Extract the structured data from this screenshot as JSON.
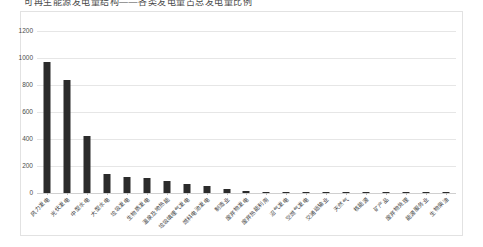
{
  "title": "可再生能源发电量结构——各类发电量占总发电量比例",
  "chart_data": {
    "type": "bar",
    "title": "可再生能源发电量结构——各类发电量占总发电量比例",
    "xlabel": "",
    "ylabel": "",
    "ylim": [
      0,
      1200
    ],
    "yticks": [
      0,
      200,
      400,
      600,
      800,
      1000,
      1200
    ],
    "grid": true,
    "legend": false,
    "bar_color": "#2b2b2b",
    "categories": [
      "风力发电",
      "光伏发电",
      "中型水电",
      "大型水电",
      "垃圾发电",
      "生物质发电",
      "温泉及地热能",
      "垃圾填埋气发电",
      "燃料电池发电",
      "制造业",
      "废弃物发电",
      "废弃热能利用",
      "沼气发电",
      "空燃气发电",
      "交通运输业",
      "天然气",
      "核能源",
      "矿产品",
      "废弃物处理",
      "能源服务业",
      "生物柴油"
    ],
    "values": [
      970,
      840,
      425,
      140,
      120,
      108,
      92,
      70,
      55,
      30,
      14,
      10,
      9,
      8,
      8,
      7,
      7,
      6,
      6,
      6,
      5
    ]
  }
}
